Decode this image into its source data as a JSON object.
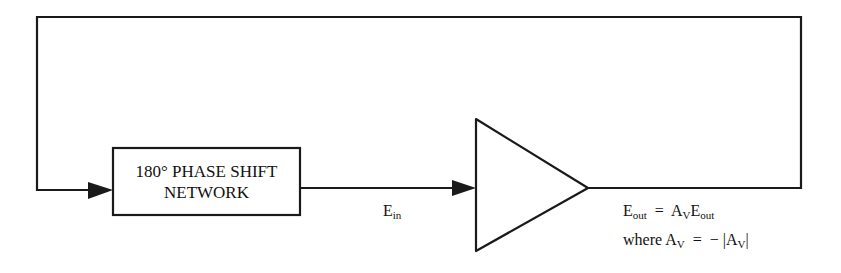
{
  "diagram": {
    "phase_shift_block": {
      "line1": "180° PHASE SHIFT",
      "line2": "NETWORK"
    },
    "input_label": {
      "main": "E",
      "sub": "in"
    },
    "output_equation": {
      "lhs_main": "E",
      "lhs_sub": "out",
      "equals": "=",
      "rhs_gain": "A",
      "rhs_gain_sub": "V",
      "rhs_main": "E",
      "rhs_sub": "out"
    },
    "gain_condition": {
      "prefix": "where A",
      "prefix_sub": "V",
      "equals": "=",
      "rhs": "− |A",
      "rhs_sub": "V",
      "rhs_close": "|"
    },
    "colors": {
      "line": "#1a1a1a",
      "background": "#ffffff"
    }
  }
}
